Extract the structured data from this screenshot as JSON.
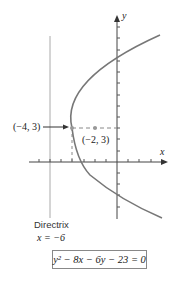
{
  "diagram": {
    "axes": {
      "x_label": "x",
      "y_label": "y"
    },
    "vertex": {
      "label": "(−4, 3)",
      "x": -4,
      "y": 3
    },
    "focus": {
      "label": "(−2, 3)",
      "x": -2,
      "y": 3
    },
    "directrix": {
      "title": "Directrix",
      "equation": "x = −6",
      "x": -6
    },
    "equation": {
      "text": "y² − 8x − 6y − 23 = 0"
    }
  },
  "colors": {
    "curve": "#777777",
    "axes": "#444444",
    "directrix": "#999999",
    "point": "#999999"
  }
}
